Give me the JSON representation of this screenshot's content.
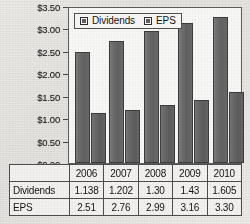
{
  "chart_data": {
    "type": "bar",
    "title": "",
    "xlabel": "",
    "ylabel": "",
    "categories": [
      "2006",
      "2007",
      "2008",
      "2009",
      "2010"
    ],
    "series": [
      {
        "name": "Dividends",
        "values": [
          2.51,
          2.76,
          2.99,
          3.16,
          3.3
        ],
        "color": "#656565"
      },
      {
        "name": "EPS",
        "values": [
          1.138,
          1.202,
          1.3,
          1.43,
          1.605
        ],
        "color": "#5e5e5e"
      }
    ],
    "ylim": [
      0,
      3.5
    ],
    "ytick_step": 0.5,
    "ytick_labels": [
      "$3.50",
      "$3.00",
      "$2.50",
      "$2.00",
      "$1.50",
      "$1.00",
      "$0.50",
      "$0.00"
    ],
    "ytick_values": [
      3.5,
      3.0,
      2.5,
      2.0,
      1.5,
      1.0,
      0.5,
      0.0
    ],
    "grid": false,
    "legend_position": "top-left",
    "legend_entries": [
      "Dividends",
      "EPS"
    ]
  },
  "legend": {
    "items": [
      {
        "label": "Dividends",
        "swatch_name": "legend-swatch-dividends"
      },
      {
        "label": "EPS",
        "swatch_name": "legend-swatch-eps"
      }
    ]
  },
  "axis": {
    "labels": [
      "$3.50",
      "$3.00",
      "$2.50",
      "$2.00",
      "$1.50",
      "$1.00",
      "$0.50",
      "$0.00"
    ]
  },
  "table": {
    "corner": "",
    "year_headers": [
      "2006",
      "2007",
      "2008",
      "2009",
      "2010"
    ],
    "rows": [
      {
        "label": "Dividends",
        "values": [
          "1.138",
          "1.202",
          "1.30",
          "1.43",
          "1.605"
        ]
      },
      {
        "label": "EPS",
        "values": [
          "2.51",
          "2.76",
          "2.99",
          "3.16",
          "3.30"
        ]
      }
    ]
  }
}
